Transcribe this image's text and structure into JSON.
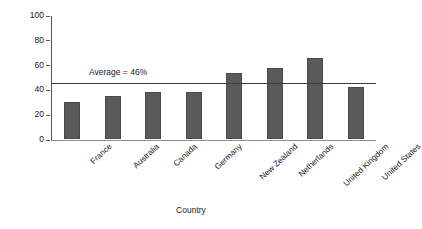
{
  "chart_data": {
    "type": "bar",
    "title": "",
    "xlabel": "Country",
    "ylabel": "Percentage of patients",
    "categories": [
      "France",
      "Australia",
      "Canada",
      "Germany",
      "New Zealand",
      "Netherlands",
      "United Kingdom",
      "United States"
    ],
    "values": [
      30,
      35,
      38,
      38,
      53,
      57,
      65,
      42
    ],
    "ylim": [
      0,
      100
    ],
    "yticks": [
      0,
      20,
      40,
      60,
      80,
      100
    ],
    "ytick_labels": [
      "0",
      "20",
      "40",
      "60",
      "80",
      "100"
    ],
    "grid": false,
    "legend": null,
    "bar_color": "#5a5a5a",
    "annotations": [
      {
        "name": "average-reference-line",
        "label": "Average = 46%",
        "value": 46,
        "orientation": "horizontal",
        "color": "#3c3c3c"
      }
    ]
  }
}
